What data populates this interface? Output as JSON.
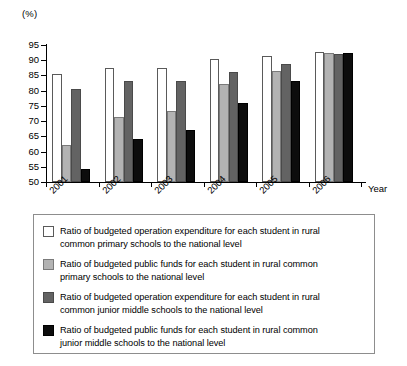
{
  "chart_data": {
    "type": "bar",
    "title": "",
    "subtitle": "",
    "unit_label": "(%)",
    "xlabel": "Year",
    "ylabel": "",
    "ylim": [
      50,
      95
    ],
    "yticks": [
      50,
      55,
      60,
      65,
      70,
      75,
      80,
      85,
      90,
      95
    ],
    "grid": false,
    "legend_position": "below-plot",
    "categories": [
      "2001",
      "2002",
      "2003",
      "2004",
      "2005",
      "2006"
    ],
    "series": [
      {
        "name": "Ratio of budgeted operation expenditure for each student in rural common primary schools to the national level",
        "key": "op-exp-primary",
        "color": "#ffffff",
        "values": [
          85.5,
          87.3,
          87.3,
          90.5,
          91.5,
          92.7
        ]
      },
      {
        "name": "Ratio of budgeted public funds for each student in rural common primary schools to the national level",
        "key": "public-funds-primary",
        "color": "#b3b3b3",
        "values": [
          62.3,
          71.3,
          73.3,
          82.3,
          86.5,
          92.4
        ]
      },
      {
        "name": "Ratio of budgeted operation expenditure for each student in rural common junior middle schools to the national level",
        "key": "op-exp-junior-middle",
        "color": "#636363",
        "values": [
          80.4,
          83.1,
          83.1,
          86.0,
          88.7,
          92.2
        ]
      },
      {
        "name": "Ratio of budgeted public funds for each student in rural common junior middle schools to the national level",
        "key": "public-funds-junior-middle",
        "color": "#0d0d0d",
        "values": [
          54.3,
          64.2,
          67.1,
          75.8,
          83.2,
          92.3
        ]
      }
    ]
  },
  "legend": {
    "entries": [
      {
        "swatch": "#ffffff",
        "line1": "Ratio of budgeted operation expenditure for each student in rural",
        "line2": "common primary schools to the national level"
      },
      {
        "swatch": "#b3b3b3",
        "line1": "Ratio of budgeted public funds for each student in rural common",
        "line2": "primary schools to the national level"
      },
      {
        "swatch": "#636363",
        "line1": "Ratio of budgeted operation expenditure for each student in rural",
        "line2": "common junior middle schools to the national level"
      },
      {
        "swatch": "#0d0d0d",
        "line1": "Ratio of budgeted public funds for each student in rural common",
        "line2": "junior middle schools to the national level"
      }
    ]
  }
}
